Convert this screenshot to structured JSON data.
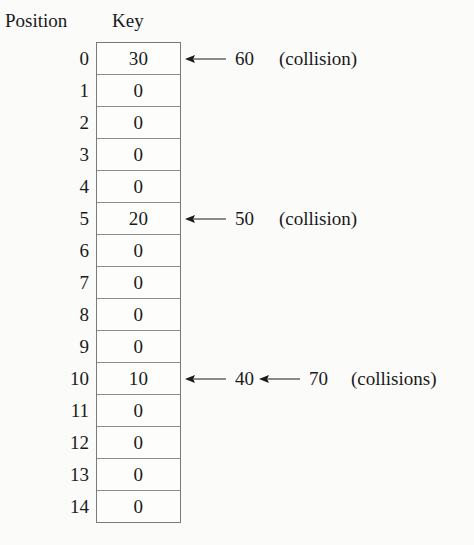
{
  "headers": {
    "position": "Position",
    "key": "Key"
  },
  "colors": {
    "background": "#fbfbfa",
    "cell_background": "#fdfdfc",
    "border": "#8c8c8c",
    "outer_border": "#7a7a7a",
    "text": "#1a1a1a"
  },
  "icons": {
    "arrow": "left-arrow-icon"
  },
  "table": {
    "rows": [
      {
        "position": "0",
        "key": "30",
        "annotations": [
          {
            "arrow": true,
            "value": "60"
          }
        ],
        "note": "(collision)"
      },
      {
        "position": "1",
        "key": "0",
        "annotations": [],
        "note": ""
      },
      {
        "position": "2",
        "key": "0",
        "annotations": [],
        "note": ""
      },
      {
        "position": "3",
        "key": "0",
        "annotations": [],
        "note": ""
      },
      {
        "position": "4",
        "key": "0",
        "annotations": [],
        "note": ""
      },
      {
        "position": "5",
        "key": "20",
        "annotations": [
          {
            "arrow": true,
            "value": "50"
          }
        ],
        "note": "(collision)"
      },
      {
        "position": "6",
        "key": "0",
        "annotations": [],
        "note": ""
      },
      {
        "position": "7",
        "key": "0",
        "annotations": [],
        "note": ""
      },
      {
        "position": "8",
        "key": "0",
        "annotations": [],
        "note": ""
      },
      {
        "position": "9",
        "key": "0",
        "annotations": [],
        "note": ""
      },
      {
        "position": "10",
        "key": "10",
        "annotations": [
          {
            "arrow": true,
            "value": "40"
          },
          {
            "arrow": true,
            "value": "70"
          }
        ],
        "note": "(collisions)"
      },
      {
        "position": "11",
        "key": "0",
        "annotations": [],
        "note": ""
      },
      {
        "position": "12",
        "key": "0",
        "annotations": [],
        "note": ""
      },
      {
        "position": "13",
        "key": "0",
        "annotations": [],
        "note": ""
      },
      {
        "position": "14",
        "key": "0",
        "annotations": [],
        "note": ""
      }
    ]
  }
}
